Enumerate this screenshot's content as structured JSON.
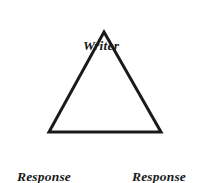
{
  "diagram": {
    "shape": "triangle",
    "background_color": "#ffffff",
    "line_color": "#1a1a1a",
    "line_width": 3,
    "vertices": [
      {
        "id": "apex",
        "x": 104,
        "y": 32
      },
      {
        "id": "bottom-left",
        "x": 49,
        "y": 132
      },
      {
        "id": "bottom-right",
        "x": 161,
        "y": 132
      }
    ],
    "nodes": {
      "top": {
        "label": "Writer",
        "lines": [
          "Writer"
        ]
      },
      "bottom_left": {
        "label": "Response partner",
        "lines": [
          "Response",
          "partner"
        ]
      },
      "bottom_right": {
        "label": "Response partner",
        "lines": [
          "Response",
          "partner"
        ]
      }
    }
  }
}
